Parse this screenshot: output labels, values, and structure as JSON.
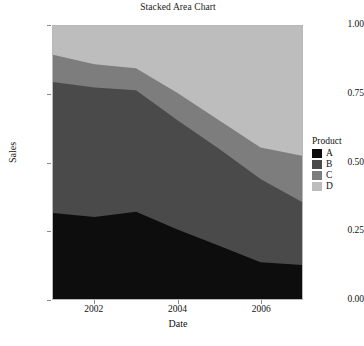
{
  "chart_data": {
    "type": "area",
    "title": "Stacked Area Chart",
    "xlabel": "Date",
    "ylabel": "Sales",
    "xlim": [
      2001,
      2007
    ],
    "ylim": [
      0,
      1
    ],
    "grid": false,
    "stacked": true,
    "legend_position": "right",
    "legend_title": "Product",
    "x": [
      2001,
      2002,
      2003,
      2004,
      2005,
      2006,
      2007
    ],
    "x_ticks": [
      "2002",
      "2004",
      "2006"
    ],
    "x_tick_values": [
      2002,
      2004,
      2006
    ],
    "y_ticks": [
      "0.00",
      "0.25",
      "0.50",
      "0.75",
      "1.00"
    ],
    "y_tick_values": [
      0.0,
      0.25,
      0.5,
      0.75,
      1.0
    ],
    "series": [
      {
        "name": "A",
        "color": "#0d0d0d",
        "values": [
          0.315,
          0.3,
          0.32,
          0.255,
          0.195,
          0.135,
          0.125
        ],
        "cumulative_top": [
          0.315,
          0.3,
          0.32,
          0.255,
          0.195,
          0.135,
          0.125
        ]
      },
      {
        "name": "B",
        "color": "#4a4a4a",
        "values": [
          0.48,
          0.475,
          0.445,
          0.4,
          0.355,
          0.305,
          0.23
        ],
        "cumulative_top": [
          0.795,
          0.775,
          0.765,
          0.655,
          0.55,
          0.44,
          0.355
        ]
      },
      {
        "name": "C",
        "color": "#7d7d7d",
        "values": [
          0.1,
          0.085,
          0.08,
          0.1,
          0.105,
          0.115,
          0.17
        ],
        "cumulative_top": [
          0.895,
          0.86,
          0.845,
          0.755,
          0.655,
          0.555,
          0.525
        ]
      },
      {
        "name": "D",
        "color": "#bdbdbd",
        "values": [
          0.105,
          0.14,
          0.155,
          0.245,
          0.345,
          0.445,
          0.475
        ],
        "cumulative_top": [
          1.0,
          1.0,
          1.0,
          1.0,
          1.0,
          1.0,
          1.0
        ]
      }
    ]
  },
  "legend": {
    "title": "Product",
    "items": [
      {
        "label": "A",
        "color": "#0d0d0d"
      },
      {
        "label": "B",
        "color": "#4a4a4a"
      },
      {
        "label": "C",
        "color": "#7d7d7d"
      },
      {
        "label": "D",
        "color": "#bdbdbd"
      }
    ]
  },
  "axes": {
    "x_title": "Date",
    "y_title": "Sales",
    "y_tick_labels": [
      "0.00",
      "0.25",
      "0.50",
      "0.75",
      "1.00"
    ],
    "x_tick_labels": [
      "2002",
      "2004",
      "2006"
    ]
  },
  "title": "Stacked Area Chart",
  "panel": {
    "border_color": "#b9b9b9",
    "background": "#ffffff"
  }
}
